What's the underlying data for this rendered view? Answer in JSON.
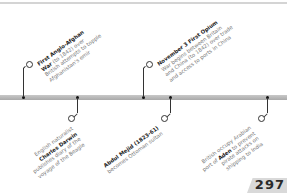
{
  "page": {
    "number": "297"
  },
  "events": [
    {
      "position": "above",
      "title": "First Anglo-Afghan War",
      "lines": [
        "First Anglo-Afghan",
        "War (to 1842) over",
        "British attempts to topple",
        "Afghanistan's emir"
      ],
      "bold": [
        "First Anglo-Afghan",
        "War"
      ]
    },
    {
      "position": "below",
      "title": "Charles Darwin",
      "lines": [
        "English naturalist",
        "Charles Darwin",
        "publishes diary of the",
        "voyage of the Beagle"
      ]
    },
    {
      "position": "above",
      "title": "November 3 First Opium War",
      "lines": [
        "November 3 First Opium",
        "War begins between Britain",
        "and China (to 1842) over trade",
        "and access to ports in China"
      ]
    },
    {
      "position": "below",
      "title": "Abdul Mejid",
      "lines": [
        "Abdul Mejid (1823-61)",
        "becomes Ottoman sultan"
      ]
    },
    {
      "position": "below",
      "title": "Aden",
      "lines": [
        "British occupy Arabian",
        "port of Aden to prevent",
        "pirate attacks on",
        "shipping to India"
      ]
    }
  ],
  "colors": {
    "bar": "#b0b0b0",
    "connector": "#333333",
    "body_text": "#7a7a7a",
    "bold_text": "#222222",
    "page_tab": "#d9d9d9"
  }
}
